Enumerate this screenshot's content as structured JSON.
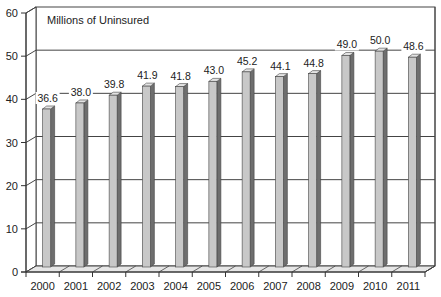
{
  "chart_data": {
    "type": "bar",
    "title": "Millions of Uninsured",
    "xlabel": "",
    "ylabel": "",
    "categories": [
      "2000",
      "2001",
      "2002",
      "2003",
      "2004",
      "2005",
      "2006",
      "2007",
      "2008",
      "2009",
      "2010",
      "2011"
    ],
    "values": [
      36.6,
      38.0,
      39.8,
      41.9,
      41.8,
      43.0,
      45.2,
      44.1,
      44.8,
      49.0,
      50.0,
      48.6
    ],
    "value_labels": [
      "36.6",
      "38.0",
      "39.8",
      "41.9",
      "41.8",
      "43.0",
      "45.2",
      "44.1",
      "44.8",
      "49.0",
      "50.0",
      "48.6"
    ],
    "ylim": [
      0,
      60
    ],
    "yticks": [
      0,
      10,
      20,
      30,
      40,
      50,
      60
    ],
    "grid": true,
    "legend": "none",
    "style": "3d-bar",
    "colors": {
      "bar_front": "#c8c8c8",
      "bar_side": "#6e6e6e",
      "bar_top": "#e4e4e4",
      "grid": "#444444",
      "floor": "#e6e6e6",
      "axis": "#333333"
    }
  }
}
